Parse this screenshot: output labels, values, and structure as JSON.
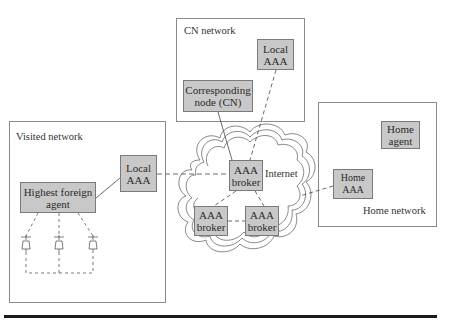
{
  "networks": {
    "cn": {
      "label": "CN network"
    },
    "visited": {
      "label": "Visited network"
    },
    "home": {
      "label": "Home network"
    }
  },
  "nodes": {
    "cn_local_aaa": "Local\nAAA",
    "corresponding_node": "Corresponding\nnode (CN)",
    "visited_local_aaa": "Local\nAAA",
    "highest_foreign_agent": "Highest foreign\nagent",
    "broker_main": "AAA\nbroker",
    "broker_left": "AAA\nbroker",
    "broker_right": "AAA\nbroker",
    "home_agent": "Home\nagent",
    "home_aaa": "Home\nAAA"
  },
  "internet_label": "Internet",
  "colors": {
    "node_fill": "#c8c8c8",
    "border": "#8a8a8a",
    "rule": "#1a1a1a"
  }
}
